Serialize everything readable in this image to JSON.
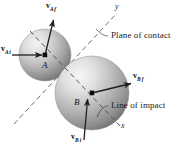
{
  "figure": {
    "type": "physics-diagram",
    "background_color": "#ffffff",
    "line_color": "#2b2b2b",
    "dash_color": "#6e6e6e"
  },
  "spheres": [
    {
      "id": "A",
      "label": "A",
      "cx": 45,
      "cy": 55,
      "r": 26,
      "highlight_color": "#f0f0f0",
      "mid_color": "#b8b8b8",
      "shadow_color": "#6a6a6a"
    },
    {
      "id": "B",
      "label": "B",
      "cx": 92,
      "cy": 93,
      "r": 37,
      "highlight_color": "#f2f2f2",
      "mid_color": "#bcbcbc",
      "shadow_color": "#6a6a6a"
    }
  ],
  "vectors": [
    {
      "name": "v-A-initial",
      "symbol": "v",
      "subscript": "A i",
      "sub_body": "A",
      "sub_state": "i",
      "from": [
        12,
        55
      ],
      "to": [
        44,
        55
      ],
      "label_x": 2,
      "label_y": 47
    },
    {
      "name": "v-A-final",
      "symbol": "v",
      "subscript": "A f",
      "sub_body": "A",
      "sub_state": "f",
      "from": [
        45,
        55
      ],
      "to": [
        53,
        18
      ],
      "label_x": 47,
      "label_y": 2
    },
    {
      "name": "v-B-final",
      "symbol": "v",
      "subscript": "B f",
      "sub_body": "B",
      "sub_state": "f",
      "from": [
        92,
        93
      ],
      "to": [
        134,
        83
      ],
      "label_x": 135,
      "label_y": 73
    },
    {
      "name": "v-B-initial",
      "symbol": "v",
      "subscript": "B i",
      "sub_body": "B",
      "sub_state": "i",
      "from": [
        84,
        140
      ],
      "to": [
        88,
        97
      ],
      "label_x": 74,
      "label_y": 130
    }
  ],
  "axes": [
    {
      "name": "y-axis-plane-of-contact",
      "label": "y",
      "from": [
        14,
        124
      ],
      "to": [
        117,
        13
      ],
      "label_x": 116,
      "label_y": 4
    },
    {
      "name": "x-axis-line-of-impact",
      "label": "x",
      "from": [
        55,
        57
      ],
      "to": [
        122,
        128
      ],
      "label_x": 122,
      "label_y": 124
    }
  ],
  "annotations": [
    {
      "name": "plane-of-contact-label",
      "text": "Plane of contact",
      "x": 110,
      "y": 34,
      "leader_from": [
        108,
        41
      ],
      "leader_to": [
        96,
        30
      ]
    },
    {
      "name": "line-of-impact-label",
      "text": "Line of impact",
      "x": 110,
      "y": 104,
      "leader_from": [
        108,
        111
      ],
      "leader_to": [
        97,
        118
      ]
    }
  ]
}
